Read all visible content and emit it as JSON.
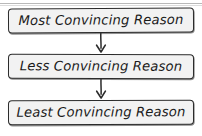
{
  "diagram": {
    "type": "vertical-flowchart",
    "background_color": "#ffffff",
    "node_fill_color": "#f2f2f2",
    "node_border_color": "#2b2b2b",
    "text_color": "#1a1a1a",
    "arrow_color": "#2b2b2b",
    "top_rule_color": "#b9b9b9",
    "nodes": [
      {
        "id": "node-1",
        "label": "Most Convincing Reason"
      },
      {
        "id": "node-2",
        "label": "Less Convincing Reason"
      },
      {
        "id": "node-3",
        "label": "Least Convincing Reason"
      }
    ],
    "connectors": [
      {
        "id": "arrow-1",
        "from": "node-1",
        "to": "node-2",
        "direction": "down",
        "icon": "arrow-down-icon"
      },
      {
        "id": "arrow-2",
        "from": "node-2",
        "to": "node-3",
        "direction": "down",
        "icon": "arrow-down-icon"
      }
    ]
  }
}
